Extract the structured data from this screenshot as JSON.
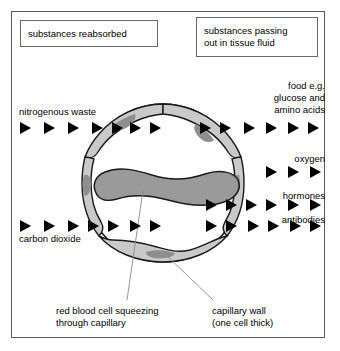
{
  "diagram": {
    "frame": {
      "border_color": "#5b5b5b"
    },
    "callouts": [
      {
        "id": "substances-reabsorbed",
        "line1": "substances reabsorbed",
        "line2": ""
      },
      {
        "id": "substances-passing-out",
        "line1": "substances passing",
        "line2": "out in tissue fluid"
      }
    ],
    "labels": {
      "nitrogenous_waste": "nitrogenous waste",
      "carbon_dioxide": "carbon dioxide",
      "food": {
        "line1": "food e.g.",
        "line2": "glucose and",
        "line3": "amino acids"
      },
      "oxygen": "oxygen",
      "hormones": "hormones",
      "antibodies": "antibodies"
    },
    "captions": {
      "red_blood_cell": {
        "line1": "red blood cell squeezing",
        "line2": "through capillary"
      },
      "capillary_wall": {
        "line1": "capillary wall",
        "line2": "(one cell thick)"
      }
    },
    "arrow_groups": [
      {
        "name": "nitrogenous-waste-inward",
        "direction": "right",
        "count": 7,
        "row_y": 128
      },
      {
        "name": "food-outward",
        "direction": "right",
        "count": 8,
        "row_y": 128
      },
      {
        "name": "oxygen-outward",
        "direction": "right",
        "count": 3,
        "row_y": 172
      },
      {
        "name": "hormones-outward",
        "direction": "right",
        "count": 6,
        "row_y": 205
      },
      {
        "name": "carbon-dioxide-inward",
        "direction": "right",
        "count": 7,
        "row_y": 226
      },
      {
        "name": "antibodies-outward",
        "direction": "right",
        "count": 7,
        "row_y": 226
      }
    ],
    "colors": {
      "cell_fill": "#c9c9c9",
      "nucleus_fill": "#8e8e8e",
      "rbc_fill": "#9a9a9a",
      "outline": "#1a1a1a",
      "leader_line": "#8a8a8a",
      "arrow": "#000000"
    },
    "structure": {
      "capillary_center_x": 163,
      "capillary_center_y": 183,
      "capillary_radius": 79,
      "wall_thickness_note": "one cell thick"
    }
  }
}
